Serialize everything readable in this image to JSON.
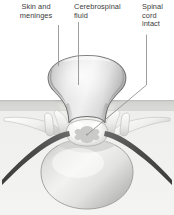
{
  "figure": {
    "background_color": "#ffffff",
    "labels": [
      {
        "id": "skin-and-meninges",
        "text": "Skin and\nmeninges",
        "color": "#3b3b3b",
        "leader": "vertical line from label down to sac wall"
      },
      {
        "id": "cerebrospinal-fluid",
        "text": "Cerebrospinal\nfluid",
        "color": "#3b3b3b",
        "leader": "vertical line from label down into sac interior"
      },
      {
        "id": "spinal-cord-intact",
        "text": "Spinal\ncord\nintact",
        "color": "#3b3b3b",
        "leader": "vertical then diagonal line down-left to spinal cord"
      }
    ],
    "anatomy": {
      "sac_label": "meningeal sac filled with cerebrospinal fluid",
      "sac_fill_color": "#d8d8d8",
      "sac_outline_color": "#6f6f6f",
      "skin_band_color": "#d5d5d2",
      "skin_band_line_color": "#b9b9b5",
      "vertebral_body_color": "#e4e4e2",
      "vertebra_outline_color": "#8a8a8a",
      "spinal_cord_color": "#fbfbfb",
      "spinal_cord_gray_matter_color": "#c9c9c9",
      "nerve_root_color": "#545454",
      "transverse_process_color": "#f4f4f2",
      "lower_background_color": "#f1f1ef"
    },
    "leader_line_color": "#8e8e8e"
  }
}
